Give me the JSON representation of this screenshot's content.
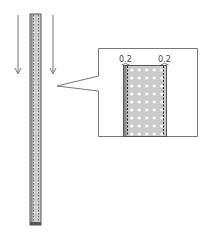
{
  "diagram": {
    "arrows": [
      {
        "name": "left-arrow",
        "direction": "down"
      },
      {
        "name": "right-arrow",
        "direction": "down"
      }
    ],
    "callout": {
      "labels": {
        "left_width": "0.2",
        "right_width": "0.2"
      }
    },
    "colors": {
      "stroke": "#555555",
      "fill": "#c8c8c8",
      "edge": "#8a8a8a",
      "dots": "#ffffff"
    }
  }
}
